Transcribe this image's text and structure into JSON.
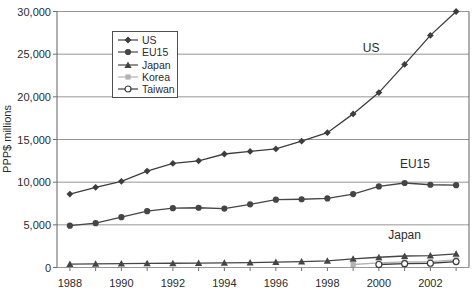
{
  "figure": {
    "background": "#ffffff",
    "text_color": "#2b2b2b",
    "grid_color": "#8a8a8a",
    "frame_color": "#6e6e6e"
  },
  "chart_data": {
    "type": "line",
    "title": "",
    "xlabel": "",
    "ylabel": "PPP$ millions",
    "x": [
      1988,
      1989,
      1990,
      1991,
      1992,
      1993,
      1994,
      1995,
      1996,
      1997,
      1998,
      1999,
      2000,
      2001,
      2002,
      2003
    ],
    "series": [
      {
        "name": "US",
        "marker": "diamond",
        "color": "#3d3d3d",
        "values": [
          8600,
          9400,
          10100,
          11300,
          12200,
          12500,
          13300,
          13600,
          13900,
          14800,
          15800,
          18000,
          20500,
          23800,
          27200,
          30000
        ]
      },
      {
        "name": "EU15",
        "marker": "circle",
        "color": "#454545",
        "values": [
          4900,
          5200,
          5900,
          6600,
          6950,
          7000,
          6900,
          7400,
          7950,
          8000,
          8100,
          8600,
          9500,
          9900,
          9700,
          9650
        ]
      },
      {
        "name": "Japan",
        "marker": "triangle",
        "color": "#454545",
        "values": [
          400,
          420,
          450,
          480,
          500,
          520,
          550,
          580,
          620,
          680,
          780,
          1000,
          1200,
          1350,
          1400,
          1600
        ]
      },
      {
        "name": "Korea",
        "marker": "square",
        "color": "#b2b2b2",
        "values": [
          null,
          null,
          null,
          null,
          null,
          null,
          null,
          null,
          null,
          null,
          null,
          350,
          550,
          650,
          700,
          900
        ]
      },
      {
        "name": "Taiwan",
        "marker": "open-circle",
        "color": "#3d3d3d",
        "values": [
          null,
          null,
          null,
          null,
          null,
          null,
          null,
          null,
          null,
          null,
          null,
          null,
          350,
          450,
          500,
          700
        ]
      }
    ],
    "xlim": [
      1987.5,
      2003.5
    ],
    "ylim": [
      0,
      30000
    ],
    "x_tick_years_labeled": [
      1988,
      1990,
      1992,
      1994,
      1996,
      1998,
      2000,
      2002
    ],
    "x_tick_labels": [
      "1988",
      "1990",
      "1992",
      "1994",
      "1996",
      "1998",
      "2000",
      "2002"
    ],
    "y_ticks": [
      0,
      5000,
      10000,
      15000,
      20000,
      25000,
      30000
    ],
    "y_tick_labels": [
      "0",
      "5,000",
      "10,000",
      "15,000",
      "20,000",
      "25,000",
      "30,000"
    ],
    "grid": "horizontal",
    "legend_position": "top-left-inside",
    "legend_labels": [
      "US",
      "EU15",
      "Japan",
      "Korea",
      "Taiwan"
    ],
    "annotations": [
      {
        "label": "US",
        "year": 1999.7,
        "value": 25700
      },
      {
        "label": "EU15",
        "year": 2001.4,
        "value": 12100
      },
      {
        "label": "Japan",
        "year": 2001.0,
        "value": 3800
      }
    ]
  }
}
